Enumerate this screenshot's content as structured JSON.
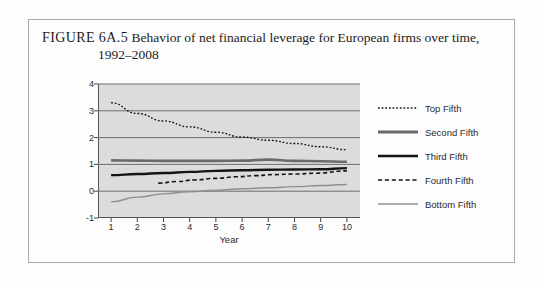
{
  "figure": {
    "label": "FIGURE 6A.5",
    "caption_line1": "Behavior of net financial leverage for European firms over time,",
    "caption_line2": "1992–2008"
  },
  "chart_data": {
    "type": "line",
    "title": "Behavior of net financial leverage for European firms over time, 1992–2008",
    "xlabel": "Year",
    "ylabel": "Net Financial Leverage",
    "xlim": [
      0.5,
      10.5
    ],
    "ylim": [
      -1,
      4
    ],
    "xticks": [
      1,
      2,
      3,
      4,
      5,
      6,
      7,
      8,
      9,
      10
    ],
    "yticks": [
      -1,
      0,
      1,
      2,
      3,
      4
    ],
    "xtick_labels": [
      "1",
      "2",
      "3",
      "4",
      "5",
      "6",
      "7",
      "8",
      "9",
      "10"
    ],
    "ytick_labels": [
      "-1",
      "0",
      "1",
      "2",
      "3",
      "4"
    ],
    "grid": true,
    "grid_color": "#6e6e6e",
    "plot_bgcolor": "#dcdcdc",
    "legend_position": "right",
    "x": [
      1,
      2,
      3,
      4,
      5,
      6,
      7,
      8,
      9,
      10
    ],
    "series": [
      {
        "name": "Top Fifth",
        "style": "dotted",
        "color": "#111111",
        "width": 1.4,
        "values": [
          3.3,
          2.9,
          2.62,
          2.4,
          2.2,
          2.02,
          1.9,
          1.78,
          1.66,
          1.55
        ]
      },
      {
        "name": "Second Fifth",
        "style": "solid",
        "color": "#6b6b6b",
        "width": 2.6,
        "values": [
          1.15,
          1.14,
          1.13,
          1.13,
          1.13,
          1.14,
          1.18,
          1.13,
          1.12,
          1.1
        ]
      },
      {
        "name": "Third Fifth",
        "style": "solid",
        "color": "#141414",
        "width": 2.4,
        "values": [
          0.6,
          0.64,
          0.68,
          0.72,
          0.76,
          0.78,
          0.8,
          0.81,
          0.82,
          0.86
        ]
      },
      {
        "name": "Fourth Fifth",
        "style": "dashed",
        "color": "#141414",
        "width": 1.6,
        "x": [
          2.8,
          3.5,
          4.2,
          5.0,
          5.8,
          6.5,
          7.2,
          8.0,
          8.8,
          10.0
        ],
        "values": [
          0.3,
          0.36,
          0.42,
          0.48,
          0.54,
          0.58,
          0.62,
          0.64,
          0.67,
          0.76
        ]
      },
      {
        "name": "Bottom Fifth",
        "style": "solid",
        "color": "#8f8f8f",
        "width": 1.4,
        "values": [
          -0.4,
          -0.22,
          -0.1,
          -0.02,
          0.04,
          0.09,
          0.13,
          0.17,
          0.21,
          0.25
        ]
      }
    ]
  },
  "legend": {
    "items": [
      {
        "label": "Top Fifth",
        "style": "dotted",
        "color": "#111111",
        "width": 1.4
      },
      {
        "label": "Second Fifth",
        "style": "solid",
        "color": "#6b6b6b",
        "width": 2.8
      },
      {
        "label": "Third Fifth",
        "style": "solid",
        "color": "#141414",
        "width": 2.4
      },
      {
        "label": "Fourth Fifth",
        "style": "dashed",
        "color": "#141414",
        "width": 1.6
      },
      {
        "label": "Bottom Fifth",
        "style": "solid",
        "color": "#8f8f8f",
        "width": 1.4
      }
    ]
  }
}
